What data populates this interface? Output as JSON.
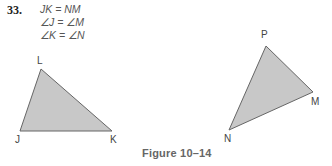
{
  "problem": {
    "number": "33.",
    "givens": [
      "JK = NM",
      "∠J = ∠M",
      "∠K = ∠N"
    ]
  },
  "figure": {
    "caption": "Figure 10–14",
    "fill_color": "#c8c8c8",
    "stroke_color": "#666666",
    "triangle_1": {
      "vertices": {
        "L": "L",
        "J": "J",
        "K": "K"
      }
    },
    "triangle_2": {
      "vertices": {
        "P": "P",
        "M": "M",
        "N": "N"
      }
    }
  }
}
